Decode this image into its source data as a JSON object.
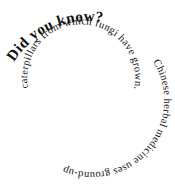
{
  "spiral": {
    "headline": "Did you know?",
    "outer_text": "Chinese herbal medicine uses ground-up",
    "inner_text": "caterpillars from which fungi have grown."
  },
  "colors": {
    "background": "#ffffff",
    "text": "#111111"
  }
}
